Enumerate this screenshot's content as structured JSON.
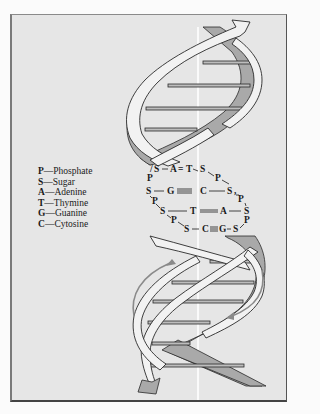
{
  "figure": {
    "type": "DNA double helix diagram",
    "colors": {
      "background": "#e6e6e6",
      "strand_front": "#f2f2f2",
      "strand_back": "#a9a9a9",
      "outline": "#2a2a2a",
      "axis_line": "#ffffff",
      "rotation_arrows": "#8a8a8a"
    }
  },
  "legend": {
    "items": [
      {
        "key": "P",
        "label": "Phosphate"
      },
      {
        "key": "S",
        "label": "Sugar"
      },
      {
        "key": "A",
        "label": "Adenine"
      },
      {
        "key": "T",
        "label": "Thymine"
      },
      {
        "key": "G",
        "label": "Guanine"
      },
      {
        "key": "C",
        "label": "Cytosine"
      }
    ],
    "separator": "—"
  },
  "base_pairs": {
    "row1": {
      "left_sugar": "S",
      "left_base": "A",
      "bond": "=",
      "right_base": "T",
      "right_sugar": "S"
    },
    "row2": {
      "left_sugar": "S",
      "left_base": "G",
      "bond": "≡",
      "right_base": "C",
      "right_sugar": "S"
    },
    "row3": {
      "left_sugar": "S",
      "left_base": "T",
      "bond": "=",
      "right_base": "A",
      "right_sugar": "S"
    },
    "row4": {
      "left_sugar": "S",
      "left_base": "C",
      "bond": "≡",
      "right_base": "G",
      "right_sugar": "S"
    },
    "phosphate": "P"
  }
}
